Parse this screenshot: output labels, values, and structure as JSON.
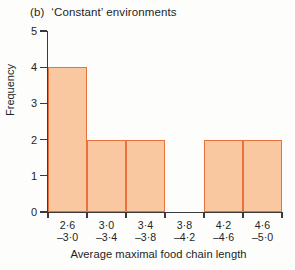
{
  "chart_data": {
    "type": "bar",
    "panel_letter": "(b)",
    "title_text": "‘Constant’ environments",
    "xlabel": "Average maximal food chain length",
    "ylabel": "Frequency",
    "ylim": [
      0,
      5
    ],
    "ytick_labels": [
      "0",
      "1",
      "2",
      "3",
      "4",
      "5"
    ],
    "ytick_values": [
      0,
      1,
      2,
      3,
      4,
      5
    ],
    "grid": false,
    "legend": null,
    "categories": [
      "2·6––3·0",
      "3·0––3·4",
      "3·4––3·8",
      "3·8––4·2",
      "4·2––4·6",
      "4·6––5·0"
    ],
    "bin_labels": [
      {
        "lower": "2·6",
        "upper": "–3·0"
      },
      {
        "lower": "3·0",
        "upper": "–3·4"
      },
      {
        "lower": "3·4",
        "upper": "–3·8"
      },
      {
        "lower": "3·8",
        "upper": "–4·2"
      },
      {
        "lower": "4·2",
        "upper": "–4·6"
      },
      {
        "lower": "4·6",
        "upper": "–5·0"
      }
    ],
    "values": [
      4,
      2,
      2,
      0,
      2,
      2
    ],
    "colors": {
      "bar_fill": "#f9c8a0",
      "bar_edge": "#e8713c",
      "axis": "#3a3a3a",
      "text": "#231f1e",
      "background": "#fdfdfc"
    }
  }
}
